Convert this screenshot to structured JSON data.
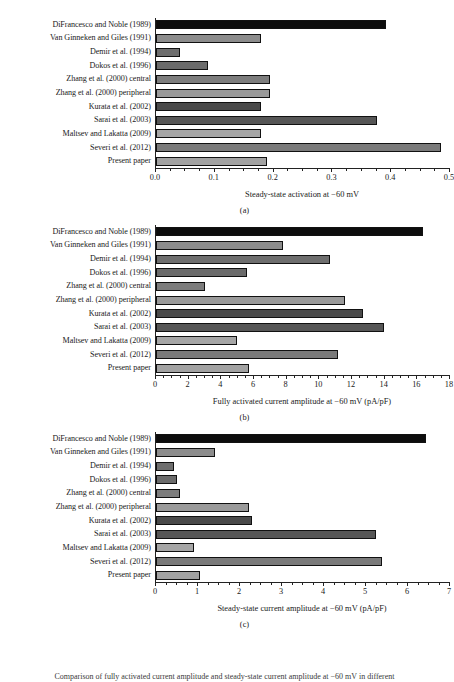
{
  "figure": {
    "caption_fragment": "Comparison of fully activated current amplitude and steady-state current amplitude at −60 mV in different"
  },
  "categories": [
    "DiFrancesco and Noble (1989)",
    "Van Ginneken and Giles (1991)",
    "Demir et al. (1994)",
    "Dokos et al. (1996)",
    "Zhang et al. (2000) central",
    "Zhang et al. (2000) peripheral",
    "Kurata et al. (2002)",
    "Sarai et al. (2003)",
    "Maltsev and Lakatta (2009)",
    "Severi et al. (2012)",
    "Present paper"
  ],
  "bar_colors": [
    "#0d0d0d",
    "#8c8c8c",
    "#6e6e6e",
    "#6b6b6b",
    "#7d7d7d",
    "#9a9a9a",
    "#4a4a4a",
    "#565656",
    "#a6a6a6",
    "#7a7a7a",
    "#a2a2a2"
  ],
  "panels": [
    {
      "letter": "(a)"
    },
    {
      "letter": "(b)"
    },
    {
      "letter": "(c)"
    }
  ],
  "chart_data": [
    {
      "type": "bar",
      "orientation": "horizontal",
      "panel": "(a)",
      "title": "",
      "xlabel": "Steady-state activation at −60 mV",
      "ylabel": "",
      "xlim": [
        0,
        0.5
      ],
      "xticks": [
        0.0,
        0.1,
        0.2,
        0.3,
        0.4,
        0.5
      ],
      "xticklabels": [
        "0.0",
        "0.1",
        "0.2",
        "0.3",
        "0.4",
        "0.5"
      ],
      "minor_tick_step": 0.025,
      "grid": false,
      "legend": false,
      "categories": [
        "DiFrancesco and Noble (1989)",
        "Van Ginneken and Giles (1991)",
        "Demir et al. (1994)",
        "Dokos et al. (1996)",
        "Zhang et al. (2000) central",
        "Zhang et al. (2000) peripheral",
        "Kurata et al. (2002)",
        "Sarai et al. (2003)",
        "Maltsev and Lakatta (2009)",
        "Severi et al. (2012)",
        "Present paper"
      ],
      "values": [
        0.392,
        0.18,
        0.041,
        0.089,
        0.194,
        0.194,
        0.18,
        0.377,
        0.18,
        0.486,
        0.19
      ]
    },
    {
      "type": "bar",
      "orientation": "horizontal",
      "panel": "(b)",
      "title": "",
      "xlabel": "Fully activated current amplitude at −60 mV (pA/pF)",
      "ylabel": "",
      "xlim": [
        0,
        18
      ],
      "xticks": [
        0,
        2,
        4,
        6,
        8,
        10,
        12,
        14,
        16,
        18
      ],
      "xticklabels": [
        "0",
        "2",
        "4",
        "6",
        "8",
        "10",
        "12",
        "14",
        "16",
        "18"
      ],
      "minor_tick_step": 0.5,
      "grid": false,
      "legend": false,
      "categories": [
        "DiFrancesco and Noble (1989)",
        "Van Ginneken and Giles (1991)",
        "Demir et al. (1994)",
        "Dokos et al. (1996)",
        "Zhang et al. (2000) central",
        "Zhang et al. (2000) peripheral",
        "Kurata et al. (2002)",
        "Sarai et al. (2003)",
        "Maltsev and Lakatta (2009)",
        "Severi et al. (2012)",
        "Present paper"
      ],
      "values": [
        16.4,
        7.8,
        10.7,
        5.6,
        3.0,
        11.6,
        12.7,
        14.0,
        5.0,
        11.2,
        5.7
      ]
    },
    {
      "type": "bar",
      "orientation": "horizontal",
      "panel": "(c)",
      "title": "",
      "xlabel": "Steady-state current amplitude at −60 mV (pA/pF)",
      "ylabel": "",
      "xlim": [
        0,
        7
      ],
      "xticks": [
        0,
        1,
        2,
        3,
        4,
        5,
        6,
        7
      ],
      "xticklabels": [
        "0",
        "1",
        "2",
        "3",
        "4",
        "5",
        "6",
        "7"
      ],
      "minor_tick_step": 0.25,
      "grid": false,
      "legend": false,
      "categories": [
        "DiFrancesco and Noble (1989)",
        "Van Ginneken and Giles (1991)",
        "Demir et al. (1994)",
        "Dokos et al. (1996)",
        "Zhang et al. (2000) central",
        "Zhang et al. (2000) peripheral",
        "Kurata et al. (2002)",
        "Sarai et al. (2003)",
        "Maltsev and Lakatta (2009)",
        "Severi et al. (2012)",
        "Present paper"
      ],
      "values": [
        6.45,
        1.4,
        0.44,
        0.5,
        0.58,
        2.23,
        2.3,
        5.25,
        0.9,
        5.4,
        1.05
      ]
    }
  ]
}
